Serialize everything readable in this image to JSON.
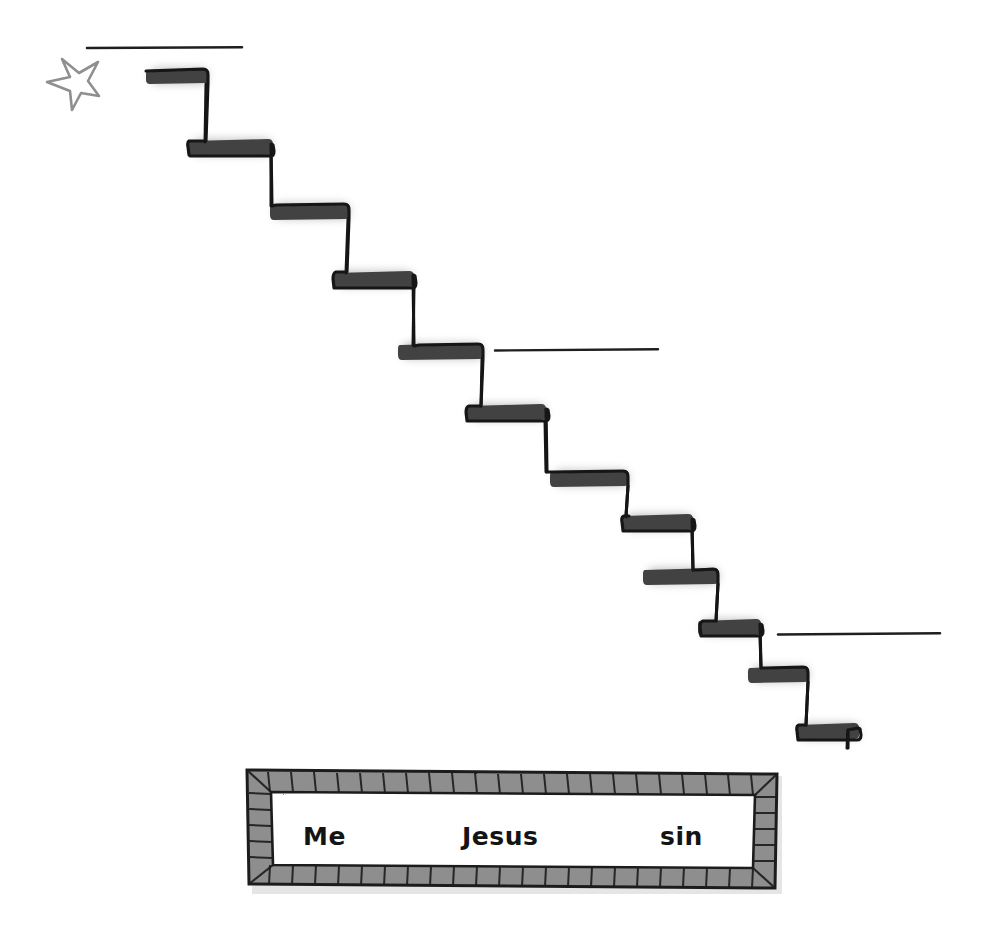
{
  "page": {
    "background_color": "#ffffff",
    "width": 990,
    "height": 945,
    "medium": "hand-drawn scanned illustration"
  },
  "colors": {
    "ink": "#1a1a1a",
    "tread_fill": "#4a4a4a",
    "shadow": "#9b9b9b",
    "star_outline": "#8a8a8a",
    "brick_fill": "#8e8e8e",
    "brick_light": "#b9b9b9",
    "paper": "#ffffff",
    "faint_text": "#8d8d94"
  },
  "top_caption": {
    "text": "presence",
    "note": "cropped at top edge, only descenders visible",
    "visible": false
  },
  "star": {
    "label": "hand-drawn star",
    "x": 42,
    "y": 60,
    "width": 58,
    "height": 52,
    "filled": false
  },
  "rules": [
    {
      "name": "rule-top",
      "x1": 87,
      "x2": 242,
      "y": 48
    },
    {
      "name": "rule-middle",
      "x1": 495,
      "x2": 658,
      "y": 350
    },
    {
      "name": "rule-bottom",
      "x1": 778,
      "x2": 940,
      "y": 634
    }
  ],
  "staircase": {
    "label": "descending staircase",
    "step_count": 12,
    "direction": "down-right",
    "steps": [
      {
        "index": 1,
        "tread_x1": 148,
        "tread_x2": 207,
        "tread_y": 75,
        "riser_x": 205,
        "riser_y2": 140
      },
      {
        "index": 2,
        "tread_x1": 190,
        "tread_x2": 272,
        "tread_y": 146,
        "riser_x": 270,
        "riser_y2": 205
      },
      {
        "index": 3,
        "tread_x1": 272,
        "tread_x2": 348,
        "tread_y": 210,
        "riser_x": 343,
        "riser_y2": 272
      },
      {
        "index": 4,
        "tread_x1": 335,
        "tread_x2": 412,
        "tread_y": 278,
        "riser_x": 406,
        "riser_y2": 345
      },
      {
        "index": 5,
        "tread_x1": 400,
        "tread_x2": 482,
        "tread_y": 350,
        "riser_x": 477,
        "riser_y2": 406
      },
      {
        "index": 6,
        "tread_x1": 468,
        "tread_x2": 545,
        "tread_y": 411,
        "riser_x": 540,
        "riser_y2": 473
      },
      {
        "index": 7,
        "tread_x1": 552,
        "tread_x2": 628,
        "tread_y": 477,
        "riser_x": 622,
        "riser_y2": 518
      },
      {
        "index": 8,
        "tread_x1": 624,
        "tread_x2": 692,
        "tread_y": 521,
        "riser_x": 686,
        "riser_y2": 572
      },
      {
        "index": 9,
        "tread_x1": 645,
        "tread_x2": 718,
        "tread_y": 575,
        "riser_x": 712,
        "riser_y2": 622
      },
      {
        "index": 10,
        "tread_x1": 700,
        "tread_x2": 760,
        "tread_y": 626,
        "riser_x": 754,
        "riser_y2": 670
      },
      {
        "index": 11,
        "tread_x1": 750,
        "tread_x2": 808,
        "tread_y": 673,
        "riser_x": 800,
        "riser_y2": 726
      },
      {
        "index": 12,
        "tread_x1": 798,
        "tread_x2": 858,
        "tread_y": 730,
        "riser_x": 848,
        "riser_y2": 748
      }
    ]
  },
  "box": {
    "name": "brick-framed-box",
    "x": 247,
    "y": 770,
    "width": 530,
    "height": 118,
    "frame_style": "hand-drawn brick / hatched border",
    "interior_color": "#ffffff",
    "words": [
      {
        "id": "word-me",
        "text": "Me"
      },
      {
        "id": "word-jesus",
        "text": "Jesus"
      },
      {
        "id": "word-sin",
        "text": "sin"
      }
    ]
  }
}
